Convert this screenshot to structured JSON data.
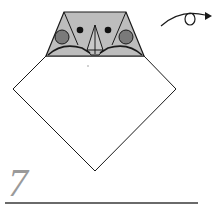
{
  "step": {
    "number": "7"
  },
  "diagram": {
    "elements": [
      "head-trapezoid",
      "left-eye",
      "right-eye",
      "left-cheek",
      "right-cheek",
      "beak-triangle",
      "body-diamond",
      "turn-over-arrow"
    ],
    "colors": {
      "paper_back": "#ffffff",
      "head_fill": "#bdbdbd",
      "cheek_fill": "#7a7a7a",
      "eye_fill": "#111111",
      "line": "#1a1a1a",
      "step_number": "#9a9a9a",
      "rule": "#6a6a6a"
    },
    "symbol": "turn-over (rotate loop arrow)"
  }
}
